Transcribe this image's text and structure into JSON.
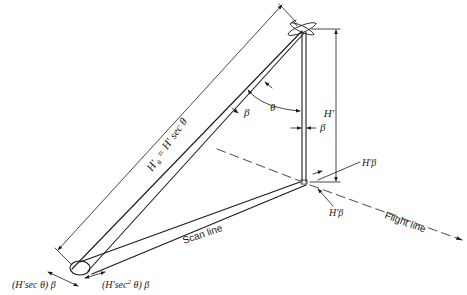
{
  "figure": {
    "type": "geometry-diagram"
  },
  "labels": {
    "slant_height": "H'θ = H' sec θ",
    "slant_height_main": "H'",
    "slant_height_sub": "θ",
    "slant_height_rest": " = H' sec θ",
    "altitude": "H'",
    "theta": "θ",
    "beta_slant": "β",
    "beta_nadir": "β",
    "nadir_cell_along": "H'β",
    "nadir_cell_across": "H'β",
    "offnadir_along": "(H'sec θ) β",
    "offnadir_across_pre": "(H'sec",
    "offnadir_across_sup": "2",
    "offnadir_across_post": " θ) β",
    "scan_line": "Scan line",
    "flight_line": "Flight line"
  },
  "icons": {
    "aircraft": "aircraft-icon",
    "flight_arrow": "arrowhead-icon"
  },
  "colors": {
    "ink": "#1a1a1a",
    "background": "#ffffff"
  }
}
